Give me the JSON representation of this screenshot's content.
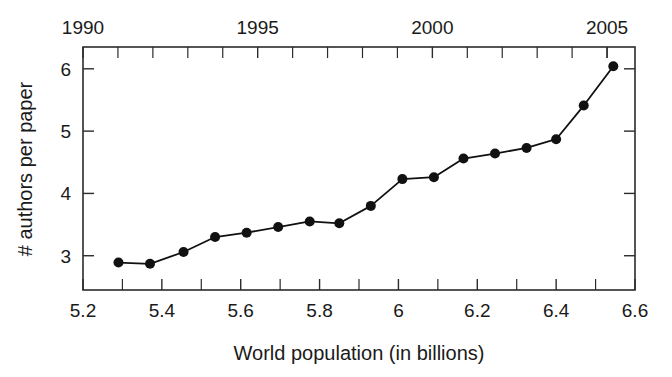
{
  "chart_data": {
    "type": "line",
    "title": "",
    "xlabel": "World population (in billions)",
    "ylabel": "# authors per paper",
    "x2label": "",
    "xlim": [
      5.2,
      6.6
    ],
    "ylim": [
      2.45,
      6.35
    ],
    "x2lim": [
      1990,
      2005.8
    ],
    "grid": false,
    "legend": null,
    "xticks": [
      5.2,
      5.4,
      5.6,
      5.8,
      6.0,
      6.2,
      6.4,
      6.6
    ],
    "xticklabels": [
      "5.2",
      "5.4",
      "5.6",
      "5.8",
      "6",
      "6.2",
      "6.4",
      "6.6"
    ],
    "xminorticks": [
      5.3,
      5.5,
      5.7,
      5.9,
      6.1,
      6.3,
      6.5
    ],
    "yticks": [
      3,
      4,
      5,
      6
    ],
    "yticklabels": [
      "3",
      "4",
      "5",
      "6"
    ],
    "x2ticks": [
      1990,
      1995,
      2000,
      2005
    ],
    "x2ticklabels": [
      "1990",
      "1995",
      "2000",
      "2005"
    ],
    "x2minorticks": [
      1991,
      1992,
      1993,
      1994,
      1996,
      1997,
      1998,
      1999,
      2001,
      2002,
      2003,
      2004,
      2005
    ],
    "series": [
      {
        "name": "authors per paper",
        "marker": "circle",
        "color": "#111111",
        "x": [
          5.29,
          5.37,
          5.455,
          5.535,
          5.615,
          5.695,
          5.775,
          5.85,
          5.93,
          6.01,
          6.09,
          6.165,
          6.245,
          6.325,
          6.4,
          6.47,
          6.545
        ],
        "y": [
          2.89,
          2.87,
          3.06,
          3.3,
          3.37,
          3.46,
          3.55,
          3.52,
          3.8,
          4.23,
          4.26,
          4.56,
          4.64,
          4.73,
          4.87,
          5.41,
          6.04
        ]
      }
    ]
  },
  "axis_labels": {
    "bottom": "World population (in billions)",
    "left": "# authors per paper"
  }
}
